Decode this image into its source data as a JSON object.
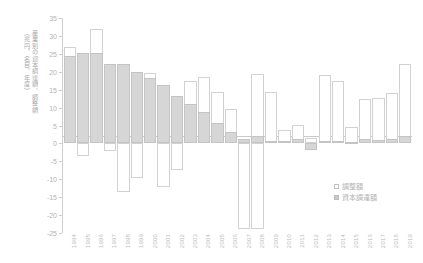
{
  "chart_data": {
    "type": "bar",
    "title": "",
    "subtitle": "",
    "xlabel": "",
    "ylabel": "産業別の資本調達額、調整額（兆円、名目、年度）",
    "ylabel_lines": [
      "産業別の資本調達額、調整額",
      "（兆円、名目、年度）"
    ],
    "ylim": [
      -25,
      35
    ],
    "ytick_step": 5,
    "yticks": [
      35,
      30,
      25,
      20,
      15,
      10,
      5,
      0,
      -5,
      -10,
      -15,
      -20,
      -25
    ],
    "ytick_labels": [
      "35",
      "30",
      "25",
      "20",
      "15",
      "10",
      "5",
      "0",
      "-5",
      "-10",
      "-15",
      "-20",
      "-25"
    ],
    "grid": false,
    "legend_position": "bottom-right",
    "categories": [
      "1994",
      "1995",
      "1996",
      "1997",
      "1998",
      "1999",
      "2000",
      "2001",
      "2002",
      "2003",
      "2004",
      "2005",
      "2006",
      "2007",
      "2008",
      "2009",
      "2010",
      "2011",
      "2012",
      "2013",
      "2014",
      "2015",
      "2016",
      "2017",
      "2018",
      "2019"
    ],
    "series": [
      {
        "name": "調整額",
        "key": "adjustment",
        "style": "open",
        "color": "#ffffff",
        "edge": "#d2d2d2",
        "values": [
          27.0,
          25.3,
          32.0,
          22.3,
          22.2,
          20.0,
          19.7,
          16.2,
          13.2,
          17.3,
          18.5,
          14.3,
          9.5,
          -9.2,
          19.4,
          14.3,
          3.8,
          5.2,
          1.6,
          19.2,
          17.5,
          4.6,
          12.5,
          12.8,
          14.0,
          22.3
        ]
      },
      {
        "name": "資本調達額",
        "key": "capital_raised",
        "style": "filled",
        "color": "#d6d6d6",
        "edge": "#c4c4c4",
        "values": [
          24.4,
          25.3,
          25.1,
          22.3,
          22.2,
          20.0,
          18.2,
          16.2,
          13.2,
          11.0,
          8.9,
          5.7,
          3.3,
          1.1,
          2.1,
          0.7,
          0.6,
          1.3,
          -1.9,
          0.6,
          0.8,
          0.4,
          1.1,
          1.0,
          1.1,
          2.1
        ]
      }
    ],
    "negative_adjustment_bars": [
      {
        "year": "1995",
        "to": -3.4
      },
      {
        "year": "1997",
        "to": -2.1
      },
      {
        "year": "1998",
        "to": -13.7
      },
      {
        "year": "1999",
        "to": -9.6
      },
      {
        "year": "2001",
        "to": -12.3
      },
      {
        "year": "2002",
        "to": -7.3
      },
      {
        "year": "2007",
        "to": -24.0
      },
      {
        "year": "2008",
        "to": -23.8
      }
    ]
  },
  "legend": {
    "items": [
      {
        "label": "調整額",
        "marker": "open-square"
      },
      {
        "label": "資本調達額",
        "marker": "filled-square"
      }
    ]
  },
  "colors": {
    "adjustment_fill": "#ffffff",
    "adjustment_edge": "#d2d2d2",
    "capital_fill": "#d6d6d6",
    "capital_edge": "#c4c4c4",
    "axis": "#cfcfcf",
    "text": "#b4b4b4",
    "background": "#ffffff"
  }
}
